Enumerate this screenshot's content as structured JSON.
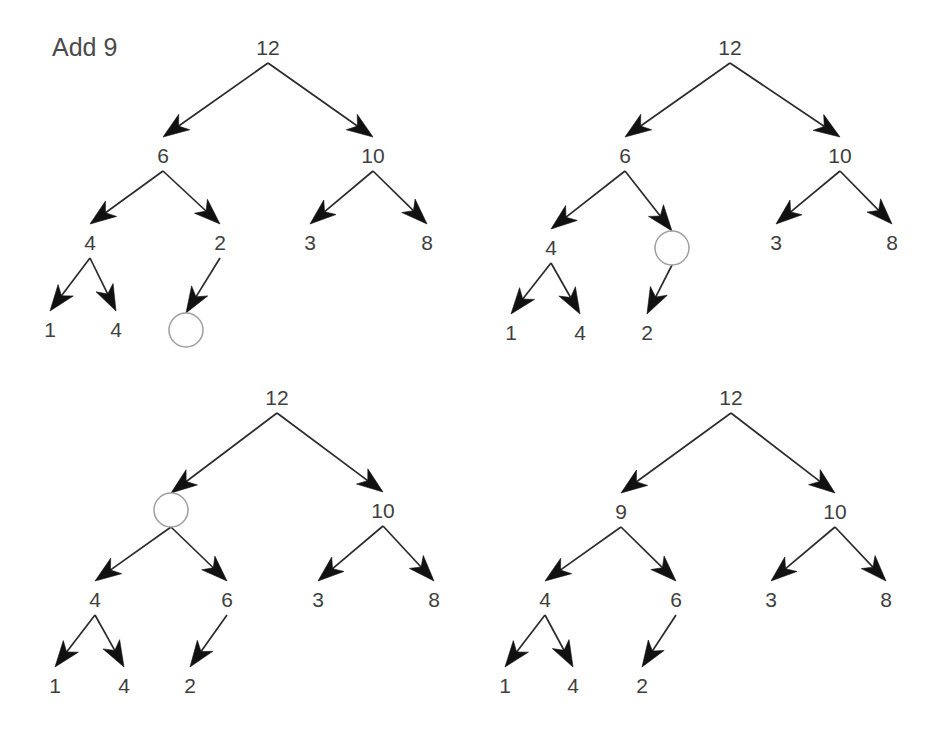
{
  "figure": {
    "caption": "Add 9",
    "caption_position": {
      "x": 52,
      "y": 56
    },
    "background_color": "#ffffff",
    "line_color": "#2b2b2b",
    "text_color": "#3f3f3f",
    "empty_node_stroke": "#a0a0a0",
    "arrow_fill": "#111111",
    "panel_count": 4
  },
  "panels": [
    {
      "name": "panel-1-before-insert",
      "nodes": [
        {
          "id": "p1-root",
          "label": "12",
          "x": 268,
          "y": 55,
          "type": "value"
        },
        {
          "id": "p1-l",
          "label": "6",
          "x": 163,
          "y": 163,
          "type": "value"
        },
        {
          "id": "p1-r",
          "label": "10",
          "x": 373,
          "y": 163,
          "type": "value"
        },
        {
          "id": "p1-ll",
          "label": "4",
          "x": 90,
          "y": 250,
          "type": "value"
        },
        {
          "id": "p1-lr",
          "label": "2",
          "x": 220,
          "y": 250,
          "type": "value"
        },
        {
          "id": "p1-rl",
          "label": "3",
          "x": 310,
          "y": 250,
          "type": "value"
        },
        {
          "id": "p1-rr",
          "label": "8",
          "x": 427,
          "y": 250,
          "type": "value"
        },
        {
          "id": "p1-lll",
          "label": "1",
          "x": 50,
          "y": 337,
          "type": "value"
        },
        {
          "id": "p1-llr",
          "label": "4",
          "x": 116,
          "y": 337,
          "type": "value"
        },
        {
          "id": "p1-lrl",
          "label": "",
          "x": 186,
          "y": 330,
          "type": "empty",
          "r": 17
        }
      ],
      "edges": [
        {
          "from": "p1-root",
          "to": "p1-l"
        },
        {
          "from": "p1-root",
          "to": "p1-r"
        },
        {
          "from": "p1-l",
          "to": "p1-ll"
        },
        {
          "from": "p1-l",
          "to": "p1-lr"
        },
        {
          "from": "p1-r",
          "to": "p1-rl"
        },
        {
          "from": "p1-r",
          "to": "p1-rr"
        },
        {
          "from": "p1-ll",
          "to": "p1-lll"
        },
        {
          "from": "p1-ll",
          "to": "p1-llr"
        },
        {
          "from": "p1-lr",
          "to": "p1-lrl"
        }
      ]
    },
    {
      "name": "panel-2-swap-2-up",
      "nodes": [
        {
          "id": "p2-root",
          "label": "12",
          "x": 730,
          "y": 55,
          "type": "value"
        },
        {
          "id": "p2-l",
          "label": "6",
          "x": 625,
          "y": 163,
          "type": "value"
        },
        {
          "id": "p2-r",
          "label": "10",
          "x": 840,
          "y": 163,
          "type": "value"
        },
        {
          "id": "p2-ll",
          "label": "4",
          "x": 551,
          "y": 255,
          "type": "value"
        },
        {
          "id": "p2-lr",
          "label": "",
          "x": 672,
          "y": 248,
          "type": "empty",
          "r": 17
        },
        {
          "id": "p2-rl",
          "label": "3",
          "x": 776,
          "y": 250,
          "type": "value"
        },
        {
          "id": "p2-rr",
          "label": "8",
          "x": 892,
          "y": 250,
          "type": "value"
        },
        {
          "id": "p2-lll",
          "label": "1",
          "x": 511,
          "y": 340,
          "type": "value"
        },
        {
          "id": "p2-llr",
          "label": "4",
          "x": 580,
          "y": 340,
          "type": "value"
        },
        {
          "id": "p2-lrl",
          "label": "2",
          "x": 647,
          "y": 340,
          "type": "value"
        }
      ],
      "edges": [
        {
          "from": "p2-root",
          "to": "p2-l"
        },
        {
          "from": "p2-root",
          "to": "p2-r"
        },
        {
          "from": "p2-l",
          "to": "p2-ll"
        },
        {
          "from": "p2-l",
          "to": "p2-lr"
        },
        {
          "from": "p2-r",
          "to": "p2-rl"
        },
        {
          "from": "p2-r",
          "to": "p2-rr"
        },
        {
          "from": "p2-ll",
          "to": "p2-lll"
        },
        {
          "from": "p2-ll",
          "to": "p2-llr"
        },
        {
          "from": "p2-lr",
          "to": "p2-lrl"
        }
      ]
    },
    {
      "name": "panel-3-swap-6-up",
      "nodes": [
        {
          "id": "p3-root",
          "label": "12",
          "x": 277,
          "y": 405,
          "type": "value"
        },
        {
          "id": "p3-l",
          "label": "",
          "x": 171,
          "y": 510,
          "type": "empty",
          "r": 17
        },
        {
          "id": "p3-r",
          "label": "10",
          "x": 383,
          "y": 518,
          "type": "value"
        },
        {
          "id": "p3-ll",
          "label": "4",
          "x": 95,
          "y": 607,
          "type": "value"
        },
        {
          "id": "p3-lr",
          "label": "6",
          "x": 227,
          "y": 607,
          "type": "value"
        },
        {
          "id": "p3-rl",
          "label": "3",
          "x": 318,
          "y": 607,
          "type": "value"
        },
        {
          "id": "p3-rr",
          "label": "8",
          "x": 434,
          "y": 607,
          "type": "value"
        },
        {
          "id": "p3-lll",
          "label": "1",
          "x": 55,
          "y": 693,
          "type": "value"
        },
        {
          "id": "p3-llr",
          "label": "4",
          "x": 124,
          "y": 693,
          "type": "value"
        },
        {
          "id": "p3-lrl",
          "label": "2",
          "x": 190,
          "y": 693,
          "type": "value"
        }
      ],
      "edges": [
        {
          "from": "p3-root",
          "to": "p3-l"
        },
        {
          "from": "p3-root",
          "to": "p3-r"
        },
        {
          "from": "p3-l",
          "to": "p3-ll"
        },
        {
          "from": "p3-l",
          "to": "p3-lr"
        },
        {
          "from": "p3-r",
          "to": "p3-rl"
        },
        {
          "from": "p3-r",
          "to": "p3-rr"
        },
        {
          "from": "p3-ll",
          "to": "p3-lll"
        },
        {
          "from": "p3-ll",
          "to": "p3-llr"
        },
        {
          "from": "p3-lr",
          "to": "p3-lrl"
        }
      ]
    },
    {
      "name": "panel-4-place-9",
      "nodes": [
        {
          "id": "p4-root",
          "label": "12",
          "x": 731,
          "y": 405,
          "type": "value"
        },
        {
          "id": "p4-l",
          "label": "9",
          "x": 621,
          "y": 519,
          "type": "value"
        },
        {
          "id": "p4-r",
          "label": "10",
          "x": 835,
          "y": 519,
          "type": "value"
        },
        {
          "id": "p4-ll",
          "label": "4",
          "x": 545,
          "y": 607,
          "type": "value"
        },
        {
          "id": "p4-lr",
          "label": "6",
          "x": 676,
          "y": 607,
          "type": "value"
        },
        {
          "id": "p4-rl",
          "label": "3",
          "x": 771,
          "y": 607,
          "type": "value"
        },
        {
          "id": "p4-rr",
          "label": "8",
          "x": 886,
          "y": 607,
          "type": "value"
        },
        {
          "id": "p4-lll",
          "label": "1",
          "x": 505,
          "y": 693,
          "type": "value"
        },
        {
          "id": "p4-llr",
          "label": "4",
          "x": 573,
          "y": 693,
          "type": "value"
        },
        {
          "id": "p4-lrl",
          "label": "2",
          "x": 642,
          "y": 693,
          "type": "value"
        }
      ],
      "edges": [
        {
          "from": "p4-root",
          "to": "p4-l"
        },
        {
          "from": "p4-root",
          "to": "p4-r"
        },
        {
          "from": "p4-l",
          "to": "p4-ll"
        },
        {
          "from": "p4-l",
          "to": "p4-lr"
        },
        {
          "from": "p4-r",
          "to": "p4-rl"
        },
        {
          "from": "p4-r",
          "to": "p4-rr"
        },
        {
          "from": "p4-ll",
          "to": "p4-lll"
        },
        {
          "from": "p4-ll",
          "to": "p4-llr"
        },
        {
          "from": "p4-lr",
          "to": "p4-lrl"
        }
      ]
    }
  ]
}
